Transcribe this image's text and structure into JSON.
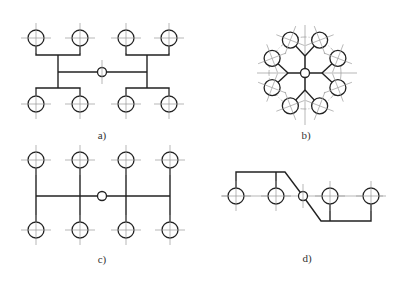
{
  "figure": {
    "panels": [
      {
        "id": "a",
        "label": "a)",
        "layout": "H-shaped branching, 8 outlets, 4 per side in pairs"
      },
      {
        "id": "b",
        "label": "b)",
        "layout": "radial, 8 outlets on circle grouped in 4 pairs"
      },
      {
        "id": "c",
        "label": "c)",
        "layout": "comb, 8 outlets in 4 vertical columns"
      },
      {
        "id": "d",
        "label": "d)",
        "layout": "in-line, 4 outlets, 2 per side"
      }
    ]
  }
}
